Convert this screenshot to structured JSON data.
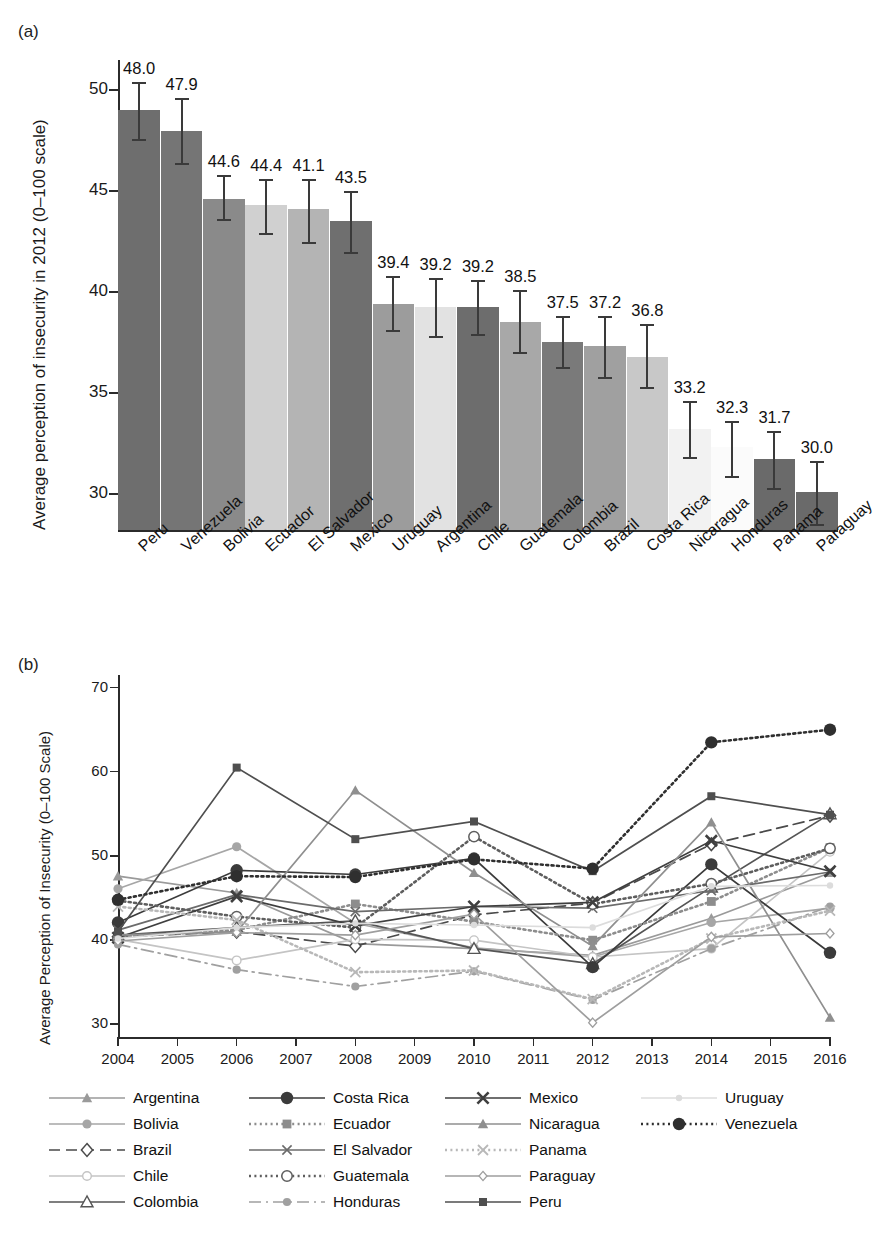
{
  "figure": {
    "panel_a_tag": "(a)",
    "panel_b_tag": "(b)"
  },
  "chart_data": [
    {
      "id": "panel_a",
      "type": "bar",
      "title": "",
      "xlabel": "",
      "ylabel": "Average perception of insecurity in 2012 (0–100 scale)",
      "ylim": [
        28.2,
        51.5
      ],
      "yticks": [
        30,
        35,
        40,
        45,
        50
      ],
      "grid": false,
      "value_labels": true,
      "categories": [
        "Peru",
        "Venezuela",
        "Bolivia",
        "Ecuador",
        "El Salvador",
        "Mexico",
        "Uruguay",
        "Argentina",
        "Chile",
        "Guatemala",
        "Colombia",
        "Brazil",
        "Costa Rica",
        "Nicaragua",
        "Honduras",
        "Panama",
        "Paraguay"
      ],
      "values": [
        48.0,
        47.9,
        44.6,
        44.4,
        41.1,
        43.5,
        39.4,
        39.2,
        39.2,
        38.5,
        37.5,
        37.2,
        36.8,
        33.2,
        32.3,
        31.7,
        30.0
      ],
      "value_label_text": [
        "48.0",
        "47.9",
        "44.6",
        "44.4",
        "41.1",
        "43.5",
        "39.4",
        "39.2",
        "39.2",
        "38.5",
        "37.5",
        "37.2",
        "36.8",
        "33.2",
        "32.3",
        "31.7",
        "30.0"
      ],
      "bar_tops": [
        49.0,
        48.0,
        44.6,
        44.3,
        44.1,
        43.5,
        39.4,
        39.25,
        39.25,
        38.5,
        37.5,
        37.3,
        36.8,
        33.2,
        32.3,
        31.7,
        30.1
      ],
      "err_low": [
        47.6,
        46.4,
        43.6,
        42.9,
        42.5,
        42.0,
        38.1,
        37.8,
        37.9,
        37.0,
        36.3,
        35.8,
        35.3,
        31.8,
        30.9,
        30.3,
        28.5
      ],
      "err_high": [
        50.4,
        49.6,
        45.8,
        45.6,
        45.6,
        45.0,
        40.8,
        40.7,
        40.6,
        40.1,
        38.8,
        38.8,
        38.4,
        34.6,
        33.6,
        33.1,
        31.6
      ],
      "bar_shades": [
        "#6e6e6e",
        "#757575",
        "#8a8a8a",
        "#d0d0d0",
        "#b4b4b4",
        "#6f6f6f",
        "#9c9c9c",
        "#e2e2e2",
        "#6d6d6d",
        "#a8a8a8",
        "#7a7a7a",
        "#a0a0a0",
        "#c8c8c8",
        "#f2f2f2",
        "#fbfbfb",
        "#6a6a6a",
        "#6a6a6a"
      ]
    },
    {
      "id": "panel_b",
      "type": "line",
      "title": "",
      "xlabel": "",
      "ylabel": "Average Perception of Insecurity (0–100 Scale)",
      "xlim": [
        2004,
        2016
      ],
      "ylim": [
        28.5,
        71.5
      ],
      "yticks": [
        30,
        40,
        50,
        60,
        70
      ],
      "xticks": [
        2004,
        2005,
        2006,
        2007,
        2008,
        2009,
        2010,
        2011,
        2012,
        2013,
        2014,
        2015,
        2016
      ],
      "x": [
        2004,
        2006,
        2008,
        2010,
        2012,
        2014,
        2016
      ],
      "grid": false,
      "legend_position": "below",
      "series": [
        {
          "name": "Argentina",
          "values": [
            47.6,
            45.6,
            39.6,
            39.0,
            38.2,
            42.6,
            48.0
          ],
          "color": "#9a9a9a",
          "dash": "solid",
          "marker": "triangle-up-filled"
        },
        {
          "name": "Bolivia",
          "values": [
            46.1,
            51.1,
            42.0,
            39.1,
            38.0,
            42.1,
            43.8
          ],
          "color": "#a6a6a6",
          "dash": "solid",
          "marker": "circle-filled"
        },
        {
          "name": "Brazil",
          "values": [
            40.4,
            41.0,
            39.3,
            43.0,
            44.4,
            51.4,
            54.8
          ],
          "color": "#4a4a4a",
          "dash": "dashed",
          "marker": "diamond-open"
        },
        {
          "name": "Chile",
          "values": [
            40.1,
            37.6,
            40.1,
            40.0,
            38.0,
            39.0,
            50.5
          ],
          "color": "#c4c4c4",
          "dash": "solid",
          "marker": "circle-open-light"
        },
        {
          "name": "Colombia",
          "values": [
            40.6,
            41.5,
            42.3,
            39.0,
            37.2,
            46.3,
            55.0
          ],
          "color": "#555555",
          "dash": "solid",
          "marker": "triangle-open"
        },
        {
          "name": "Costa Rica",
          "values": [
            42.1,
            48.3,
            47.8,
            49.7,
            36.8,
            49.0,
            38.5
          ],
          "color": "#3b3b3b",
          "dash": "solid",
          "marker": "circle-filled-lg"
        },
        {
          "name": "Ecuador",
          "values": [
            40.4,
            41.2,
            44.3,
            42.2,
            40.0,
            44.6,
            51.0
          ],
          "color": "#8d8d8d",
          "dash": "dotted",
          "marker": "square-filled"
        },
        {
          "name": "El Salvador",
          "values": [
            41.2,
            45.4,
            43.4,
            44.0,
            43.8,
            45.9,
            48.1
          ],
          "color": "#6b6b6b",
          "dash": "solid",
          "marker": "x-thin"
        },
        {
          "name": "Guatemala",
          "values": [
            44.7,
            42.8,
            41.5,
            52.3,
            44.3,
            46.7,
            50.9
          ],
          "color": "#5e5e5e",
          "dash": "dotted",
          "marker": "circle-open"
        },
        {
          "name": "Honduras",
          "values": [
            39.5,
            36.5,
            34.5,
            36.3,
            32.9,
            39.0,
            44.0
          ],
          "color": "#a0a0a0",
          "dash": "dashdot",
          "marker": "circle-filled-sm"
        },
        {
          "name": "Mexico",
          "values": [
            40.3,
            45.2,
            41.7,
            44.0,
            44.5,
            51.8,
            48.2
          ],
          "color": "#3f3f3f",
          "dash": "solid",
          "marker": "x-bold"
        },
        {
          "name": "Nicaragua",
          "values": [
            40.6,
            41.0,
            57.8,
            48.0,
            39.3,
            54.0,
            30.8
          ],
          "color": "#8f8f8f",
          "dash": "solid",
          "marker": "triangle-up-filled"
        },
        {
          "name": "Panama",
          "values": [
            44.0,
            42.4,
            36.2,
            36.4,
            33.0,
            40.2,
            43.5
          ],
          "color": "#b8b8b8",
          "dash": "dotted",
          "marker": "x-light"
        },
        {
          "name": "Paraguay",
          "values": [
            39.9,
            40.9,
            40.6,
            43.1,
            30.2,
            40.4,
            40.8
          ],
          "color": "#9e9e9e",
          "dash": "solid",
          "marker": "diamond-small"
        },
        {
          "name": "Peru",
          "values": [
            41.0,
            60.5,
            52.0,
            54.1,
            48.2,
            57.1,
            54.9
          ],
          "color": "#4f4f4f",
          "dash": "solid",
          "marker": "square-filled-sm"
        },
        {
          "name": "Uruguay",
          "values": [
            40.2,
            41.5,
            42.0,
            41.8,
            41.5,
            46.4,
            46.5
          ],
          "color": "#dcdcdc",
          "dash": "solid",
          "marker": "dot-faint"
        },
        {
          "name": "Venezuela",
          "values": [
            44.8,
            47.6,
            47.5,
            49.6,
            48.5,
            63.5,
            65.0
          ],
          "color": "#2f2f2f",
          "dash": "dotted",
          "marker": "circle-filled-lg"
        }
      ]
    }
  ],
  "panel_a": {
    "ylabel": "Average perception of insecurity in 2012 (0–100 scale)",
    "ytick_labels": [
      "50",
      "45",
      "40",
      "35",
      "30"
    ]
  },
  "panel_b": {
    "ylabel": "Average Perception of Insecurity (0–100 Scale)",
    "ytick_labels": [
      "70",
      "60",
      "50",
      "40",
      "30"
    ],
    "xtick_labels": [
      "2004",
      "2005",
      "2006",
      "2007",
      "2008",
      "2009",
      "2010",
      "2011",
      "2012",
      "2013",
      "2014",
      "2015",
      "2016"
    ],
    "legend": [
      "Argentina",
      "Costa Rica",
      "Mexico",
      "Uruguay",
      "Bolivia",
      "Ecuador",
      "Nicaragua",
      "Venezuela",
      "Brazil",
      "El Salvador",
      "Panama",
      "",
      "Chile",
      "Guatemala",
      "Paraguay",
      "",
      "Colombia",
      "Honduras",
      "Peru",
      ""
    ]
  }
}
